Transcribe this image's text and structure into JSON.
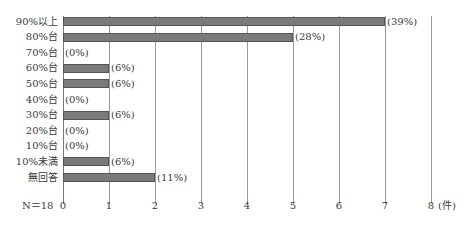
{
  "chart_data": {
    "type": "bar",
    "orientation": "horizontal",
    "title": "",
    "xlabel": "(件)",
    "ylabel": "",
    "xlim": [
      0,
      8
    ],
    "x_ticks": [
      "0",
      "1",
      "2",
      "3",
      "4",
      "5",
      "6",
      "7",
      "8"
    ],
    "grid": true,
    "n_label": "N＝18",
    "categories": [
      "90%以上",
      "80%台",
      "70%台",
      "60%台",
      "50%台",
      "40%台",
      "30%台",
      "20%台",
      "10%台",
      "10%未満",
      "無回答"
    ],
    "values": [
      7,
      5,
      0,
      1,
      1,
      0,
      1,
      0,
      0,
      1,
      2
    ],
    "value_labels": [
      "(39%)",
      "(28%)",
      "(0%)",
      "(6%)",
      "(6%)",
      "(0%)",
      "(6%)",
      "(0%)",
      "(0%)",
      "(6%)",
      "(11%)"
    ],
    "bar_color": "#7a7a7a"
  }
}
